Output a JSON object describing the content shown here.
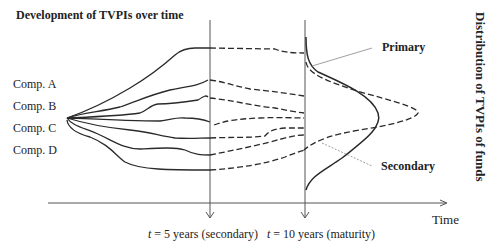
{
  "title": "Development of TVPIs over time",
  "side_title": "Distribution of TVPIs of funds",
  "companies": [
    {
      "label": "Comp. A"
    },
    {
      "label": "Comp. B"
    },
    {
      "label": "Comp. C"
    },
    {
      "label": "Comp. D"
    }
  ],
  "axis": {
    "label": "Time",
    "markers": [
      {
        "prefix": "t",
        "text": " = 5 years (secondary)"
      },
      {
        "prefix": "t",
        "text": " = 10 years (maturity)"
      }
    ]
  },
  "distributions": {
    "primary_label": "Primary",
    "secondary_label": "Secondary"
  },
  "colors": {
    "line": "#2a2a2a",
    "axis": "#555555",
    "leader": "#888888"
  }
}
